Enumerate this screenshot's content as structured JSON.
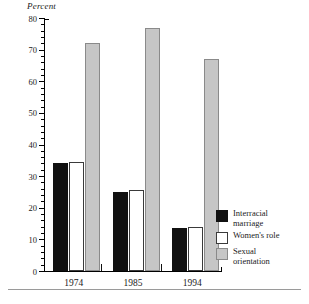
{
  "chart_data": {
    "type": "bar",
    "title": "",
    "ylabel": "Percent",
    "xlabel": "",
    "ylim": [
      0,
      80
    ],
    "ytick_step": 10,
    "yminor_step": 2,
    "ytick_labels": [
      "0",
      "10",
      "20",
      "30",
      "40",
      "50",
      "60",
      "70",
      "80"
    ],
    "grid": false,
    "legend_position": "right-bottom",
    "categories": [
      "1974",
      "1985",
      "1994"
    ],
    "series": [
      {
        "name": "Interracial marriage",
        "color": "#111111",
        "values": [
          34,
          25,
          13.5
        ]
      },
      {
        "name": "Women's role",
        "color": "#ffffff",
        "values": [
          34.5,
          25.5,
          14
        ]
      },
      {
        "name": "Sexual orientation",
        "color": "#c6c6c6",
        "values": [
          72,
          77,
          67
        ]
      }
    ]
  },
  "legend": {
    "items": [
      {
        "label_line1": "Interracial",
        "label_line2": "marriage",
        "swatch": "black"
      },
      {
        "label_line1": "Women's role",
        "label_line2": "",
        "swatch": "white"
      },
      {
        "label_line1": "Sexual",
        "label_line2": "orientation",
        "swatch": "gray"
      }
    ]
  },
  "colors": {
    "series_black": "#111111",
    "series_white": "#ffffff",
    "series_gray": "#c6c6c6",
    "axis": "#000000",
    "rule": "#9a9a9a"
  }
}
